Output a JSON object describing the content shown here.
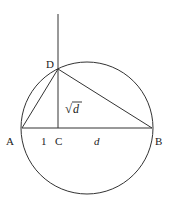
{
  "diagram": {
    "points": {
      "A": {
        "label": "A",
        "x": 22,
        "y": 128
      },
      "B": {
        "label": "B",
        "x": 152,
        "y": 128
      },
      "C": {
        "label": "C",
        "x": 58,
        "y": 128
      },
      "D": {
        "label": "D",
        "x": 58,
        "y": 69
      }
    },
    "circle": {
      "cx": 87,
      "cy": 128,
      "r": 66
    },
    "segment_labels": {
      "AC": "1",
      "CB": "d",
      "CD_radical": "√",
      "CD_var": "d"
    },
    "colors": {
      "stroke": "#333333",
      "text": "#222222",
      "background": "#ffffff"
    }
  }
}
